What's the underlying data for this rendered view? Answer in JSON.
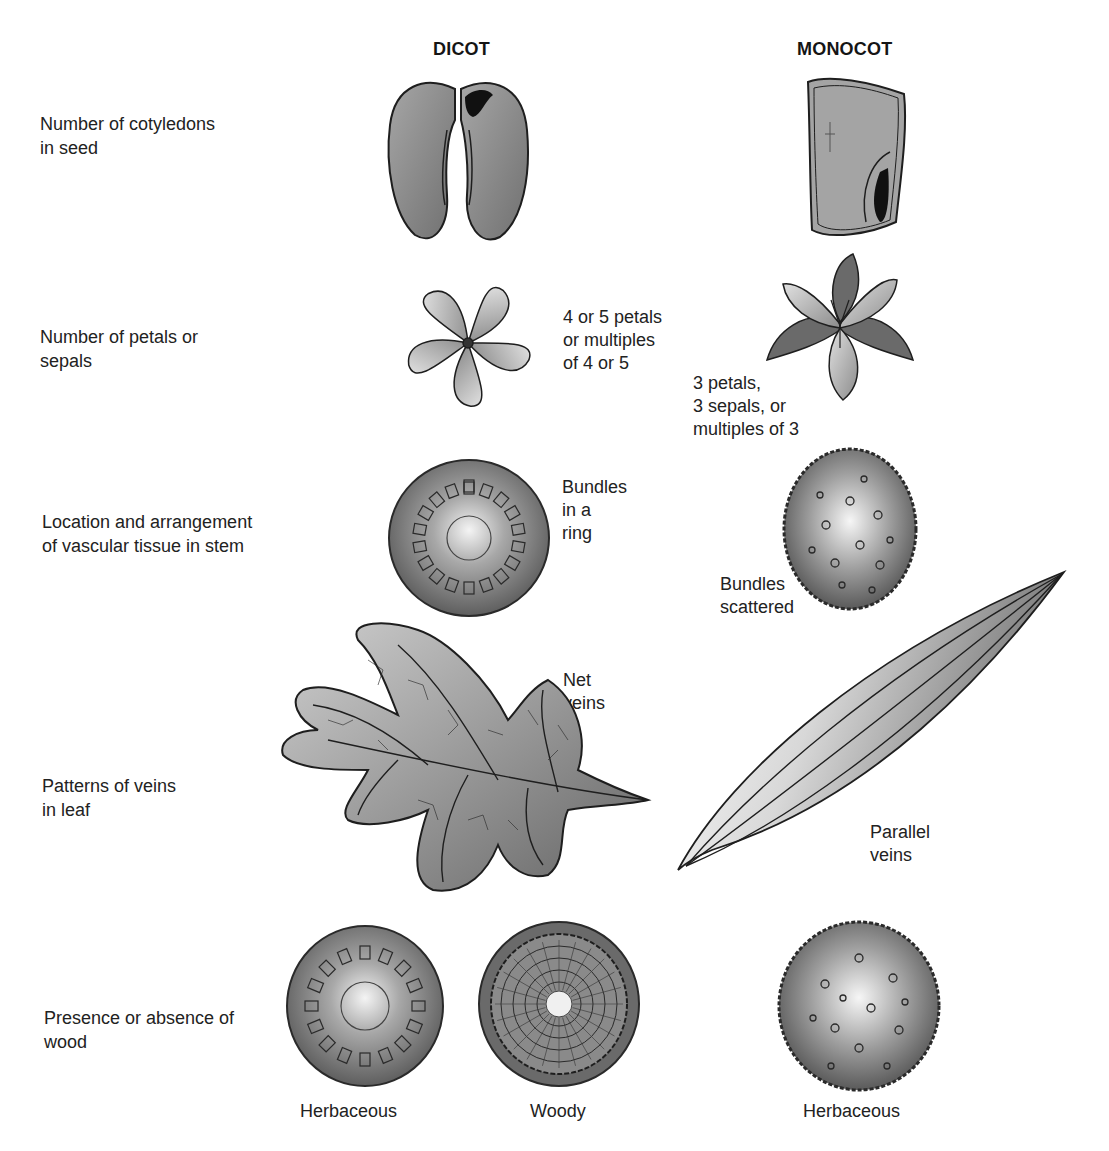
{
  "columns": {
    "dicot": "DICOT",
    "monocot": "MONOCOT"
  },
  "rows": [
    {
      "label": "Number of cotyledons\nin seed",
      "dicot_note": "",
      "monocot_note": ""
    },
    {
      "label": "Number of petals or\nsepals",
      "dicot_note": "4  or 5 petals\nor multiples\nof 4 or 5",
      "monocot_note": "3  petals,\n3 sepals, or\nmultiples of 3"
    },
    {
      "label": "Location and arrangement\nof vascular tissue in stem",
      "dicot_note": "Bundles\nin a\nring",
      "monocot_note": "Bundles\nscattered"
    },
    {
      "label": "Patterns of veins\nin leaf",
      "dicot_note": "Net\nveins",
      "monocot_note": "Parallel\nveins"
    },
    {
      "label": "Presence or absence of\nwood",
      "dicot_captions": [
        "Herbaceous",
        "Woody"
      ],
      "monocot_captions": [
        "Herbaceous"
      ]
    }
  ],
  "illustrations": {
    "dicot_seed": "bean-seed-two-cotyledons",
    "monocot_seed": "corn-kernel-one-cotyledon",
    "dicot_flower": "five-petal-flower",
    "monocot_flower": "three-petal-lily-flower",
    "dicot_stem": "stem-cross-section-ring-bundles",
    "monocot_stem": "stem-cross-section-scattered-bundles",
    "dicot_leaf": "oak-leaf-net-venation",
    "monocot_leaf": "grass-leaf-parallel-venation",
    "dicot_herbaceous_stem": "herbaceous-stem-cross-section",
    "dicot_woody_stem": "woody-stem-cross-section",
    "monocot_herbaceous_stem": "monocot-herbaceous-stem-cross-section"
  },
  "colors": {
    "ink": "#1e1e1e",
    "fill_dark": "#6e6e6e",
    "fill_mid": "#9a9a9a",
    "fill_light": "#e6e6e6"
  }
}
